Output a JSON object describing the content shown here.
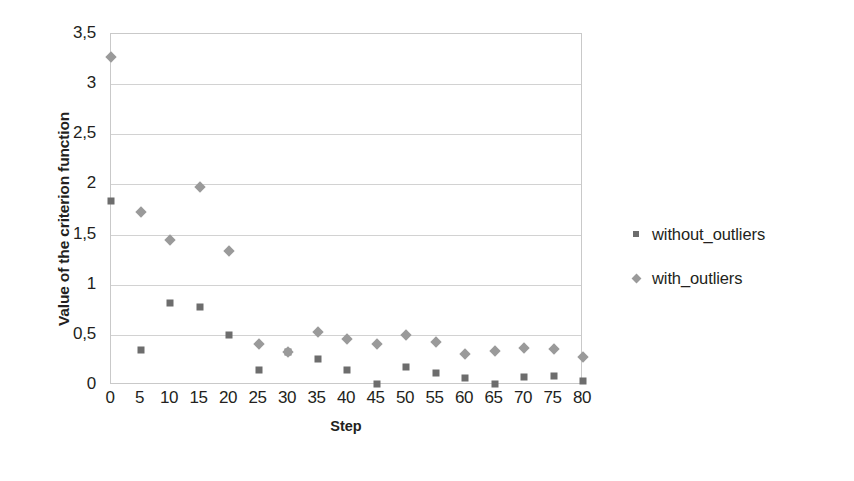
{
  "chart_data": {
    "type": "scatter",
    "title": "",
    "xlabel": "Step",
    "ylabel": "Value of the criterion function",
    "xlim": [
      0,
      80
    ],
    "ylim": [
      0,
      3.5
    ],
    "grid": true,
    "legend_position": "right",
    "y_ticks": [
      "0",
      "0,5",
      "1",
      "1,5",
      "2",
      "2,5",
      "3",
      "3,5"
    ],
    "y_tick_values": [
      0,
      0.5,
      1,
      1.5,
      2,
      2.5,
      3,
      3.5
    ],
    "x_ticks": [
      "0",
      "5",
      "10",
      "15",
      "20",
      "25",
      "30",
      "35",
      "40",
      "45",
      "50",
      "55",
      "60",
      "65",
      "70",
      "75",
      "80"
    ],
    "x_tick_values": [
      0,
      5,
      10,
      15,
      20,
      25,
      30,
      35,
      40,
      45,
      50,
      55,
      60,
      65,
      70,
      75,
      80
    ],
    "x": [
      0,
      5,
      10,
      15,
      20,
      25,
      30,
      35,
      40,
      45,
      50,
      55,
      60,
      65,
      70,
      75,
      80
    ],
    "series": [
      {
        "name": "without_outliers",
        "marker": "square",
        "color": "#6d6d6d",
        "values": [
          1.83,
          0.35,
          0.82,
          0.78,
          0.5,
          0.15,
          0.33,
          0.26,
          0.15,
          0.01,
          0.18,
          0.12,
          0.07,
          0.01,
          0.08,
          0.09,
          0.04
        ]
      },
      {
        "name": "with_outliers",
        "marker": "diamond",
        "color": "#9a9a9a",
        "values": [
          3.27,
          1.73,
          1.45,
          1.97,
          1.34,
          0.41,
          0.33,
          0.53,
          0.46,
          0.41,
          0.5,
          0.43,
          0.31,
          0.34,
          0.37,
          0.36,
          0.28
        ]
      }
    ]
  },
  "legend": {
    "entries": [
      {
        "label": "without_outliers",
        "marker": "square-marker-icon"
      },
      {
        "label": "with_outliers",
        "marker": "diamond-marker-icon"
      }
    ]
  },
  "axes": {
    "x_title": "Step",
    "y_title": "Value of the criterion function"
  }
}
